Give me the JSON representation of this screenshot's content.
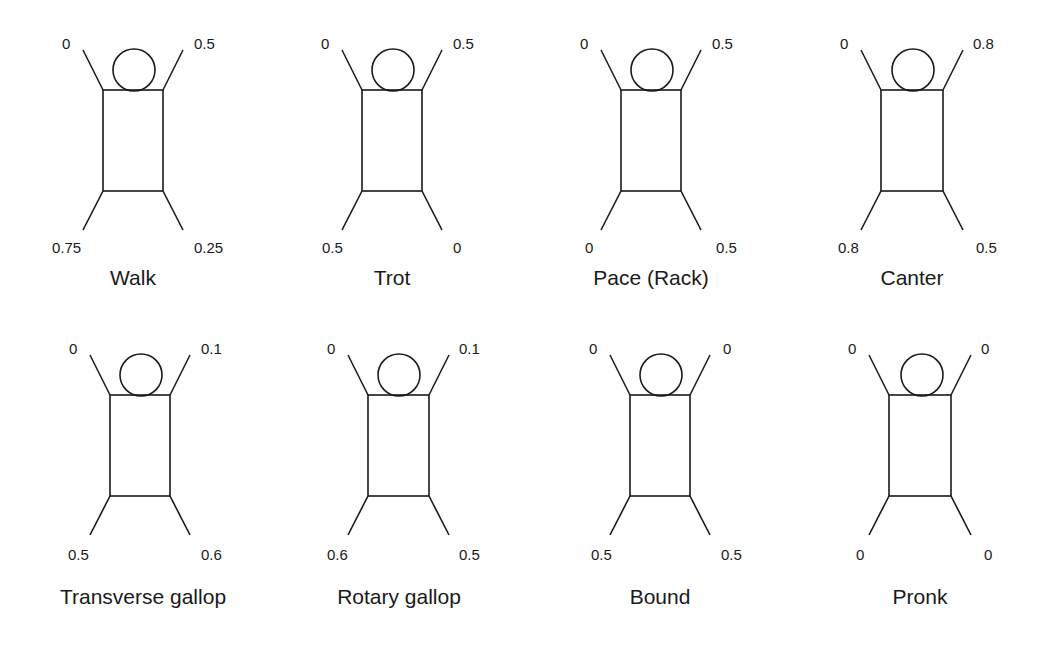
{
  "figure": {
    "stroke_color": "#1a1a1a",
    "background": "#ffffff"
  },
  "gaits": [
    {
      "name": "Walk",
      "front_left": "0",
      "front_right": "0.5",
      "hind_left": "0.75",
      "hind_right": "0.25"
    },
    {
      "name": "Trot",
      "front_left": "0",
      "front_right": "0.5",
      "hind_left": "0.5",
      "hind_right": "0"
    },
    {
      "name": "Pace (Rack)",
      "front_left": "0",
      "front_right": "0.5",
      "hind_left": "0",
      "hind_right": "0.5"
    },
    {
      "name": "Canter",
      "front_left": "0",
      "front_right": "0.8",
      "hind_left": "0.8",
      "hind_right": "0.5"
    },
    {
      "name": "Transverse gallop",
      "front_left": "0",
      "front_right": "0.1",
      "hind_left": "0.5",
      "hind_right": "0.6"
    },
    {
      "name": "Rotary gallop",
      "front_left": "0",
      "front_right": "0.1",
      "hind_left": "0.6",
      "hind_right": "0.5"
    },
    {
      "name": "Bound",
      "front_left": "0",
      "front_right": "0",
      "hind_left": "0.5",
      "hind_right": "0.5"
    },
    {
      "name": "Pronk",
      "front_left": "0",
      "front_right": "0",
      "hind_left": "0",
      "hind_right": "0"
    }
  ]
}
